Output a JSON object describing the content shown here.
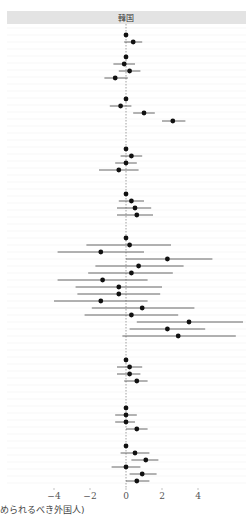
{
  "chart_data": {
    "type": "forest",
    "panel_title": "韓国",
    "xlabel": "められるべき外国人)",
    "xlim": [
      -4.8,
      6.8
    ],
    "x_ticks": [
      -4,
      -2,
      0,
      2,
      4
    ],
    "x_tick_labels": [
      "-4",
      "-2",
      "0",
      "2",
      "4"
    ],
    "reference_line": 0,
    "grid": true,
    "groups": [
      {
        "rows": [
          {
            "est": 0,
            "lo": 0,
            "hi": 0
          },
          {
            "est": 0.4,
            "lo": -0.1,
            "hi": 0.9
          }
        ]
      },
      {
        "rows": [
          {
            "est": 0,
            "lo": 0,
            "hi": 0
          },
          {
            "est": -0.1,
            "lo": -0.7,
            "hi": 0.5
          },
          {
            "est": 0.2,
            "lo": -0.4,
            "hi": 0.8
          },
          {
            "est": -0.6,
            "lo": -1.2,
            "hi": 0.1
          }
        ]
      },
      {
        "rows": [
          {
            "est": 0,
            "lo": 0,
            "hi": 0
          },
          {
            "est": -0.3,
            "lo": -0.9,
            "hi": 0.3
          },
          {
            "est": 1.0,
            "lo": 0.4,
            "hi": 1.6
          },
          {
            "est": 2.6,
            "lo": 2.0,
            "hi": 3.3
          }
        ]
      },
      {
        "rows": [
          {
            "est": 0,
            "lo": 0,
            "hi": 0
          },
          {
            "est": 0.3,
            "lo": -0.3,
            "hi": 0.9
          },
          {
            "est": 0.0,
            "lo": -0.6,
            "hi": 0.6
          },
          {
            "est": -0.4,
            "lo": -1.5,
            "hi": 0.7
          }
        ]
      },
      {
        "rows": [
          {
            "est": 0,
            "lo": 0,
            "hi": 0
          },
          {
            "est": 0.3,
            "lo": -0.4,
            "hi": 1.0
          },
          {
            "est": 0.5,
            "lo": -0.5,
            "hi": 1.4
          },
          {
            "est": 0.6,
            "lo": -0.5,
            "hi": 1.5
          }
        ]
      },
      {
        "rows": [
          {
            "est": 0,
            "lo": 0,
            "hi": 0
          },
          {
            "est": 0.2,
            "lo": -2.2,
            "hi": 2.5
          },
          {
            "est": -1.4,
            "lo": -3.8,
            "hi": 1.0
          },
          {
            "est": 2.3,
            "lo": 0.0,
            "hi": 4.8
          },
          {
            "est": 0.7,
            "lo": -1.7,
            "hi": 3.2
          },
          {
            "est": 0.3,
            "lo": -2.1,
            "hi": 2.6
          },
          {
            "est": -1.3,
            "lo": -3.8,
            "hi": 1.2
          },
          {
            "est": -0.4,
            "lo": -2.8,
            "hi": 2.0
          },
          {
            "est": -0.4,
            "lo": -2.7,
            "hi": 1.9
          },
          {
            "est": -1.4,
            "lo": -4.0,
            "hi": 1.2
          },
          {
            "est": 0.9,
            "lo": -1.9,
            "hi": 3.8
          },
          {
            "est": 0.3,
            "lo": -2.3,
            "hi": 2.9
          },
          {
            "est": 3.5,
            "lo": 0.6,
            "hi": 6.5
          },
          {
            "est": 2.3,
            "lo": 0.2,
            "hi": 4.4
          },
          {
            "est": 2.9,
            "lo": -0.2,
            "hi": 6.1
          }
        ]
      },
      {
        "rows": [
          {
            "est": 0,
            "lo": 0,
            "hi": 0
          },
          {
            "est": 0.2,
            "lo": -0.5,
            "hi": 0.9
          },
          {
            "est": 0.2,
            "lo": -0.5,
            "hi": 0.8
          },
          {
            "est": 0.6,
            "lo": -0.1,
            "hi": 1.2
          }
        ]
      },
      {
        "rows": [
          {
            "est": 0,
            "lo": 0,
            "hi": 0
          },
          {
            "est": 0.0,
            "lo": -0.6,
            "hi": 0.6
          },
          {
            "est": 0.0,
            "lo": -0.6,
            "hi": 0.5
          },
          {
            "est": 0.6,
            "lo": 0.0,
            "hi": 1.2
          }
        ]
      },
      {
        "rows": [
          {
            "est": 0,
            "lo": 0,
            "hi": 0
          },
          {
            "est": 0.5,
            "lo": -0.3,
            "hi": 1.3
          },
          {
            "est": 1.1,
            "lo": 0.3,
            "hi": 1.8
          },
          {
            "est": 0.0,
            "lo": -0.8,
            "hi": 0.8
          },
          {
            "est": 0.9,
            "lo": 0.2,
            "hi": 1.7
          },
          {
            "est": 0.6,
            "lo": 0.0,
            "hi": 1.3
          }
        ]
      }
    ]
  },
  "layout": {
    "row_y": [
      [
        35,
        42
      ],
      [
        57,
        64,
        71,
        78
      ],
      [
        99,
        106,
        113,
        121
      ],
      [
        149,
        156,
        163,
        170
      ],
      [
        194,
        201,
        208,
        215
      ],
      [
        238,
        245,
        252,
        259,
        266,
        273,
        280,
        287,
        294,
        301,
        308,
        315,
        322,
        329,
        336
      ],
      [
        360,
        367,
        374,
        381
      ],
      [
        408,
        415,
        422,
        429
      ],
      [
        446,
        453,
        460,
        467,
        474,
        481
      ]
    ]
  },
  "colors": {
    "strip_bg": "#e3e3e3",
    "panel_bg": "#ffffff",
    "grid": "#f1f1f1",
    "point": "#111111",
    "ci_line": "#555555",
    "ref_line": "#888888"
  }
}
